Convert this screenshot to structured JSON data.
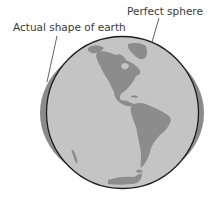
{
  "diagram": {
    "labels": {
      "actual_shape": "Actual shape of earth",
      "perfect_sphere": "Perfect sphere"
    },
    "shapes": {
      "perfect_sphere": {
        "cx": 122.5,
        "cy": 112.5,
        "r": 76
      },
      "actual_shape": {
        "cx": 122,
        "cy": 113,
        "rx": 82,
        "ry": 70
      }
    },
    "colors": {
      "ocean": "#c4c4c4",
      "land": "#8c8c8c",
      "oblate_earth": "#8a8a8a",
      "outline": "#1e1e1e",
      "leader_line": "#3a3a3a",
      "text": "#3a3a3a"
    },
    "continents": [
      "North America",
      "Central America",
      "South America",
      "Greenland",
      "Antarctica"
    ]
  }
}
